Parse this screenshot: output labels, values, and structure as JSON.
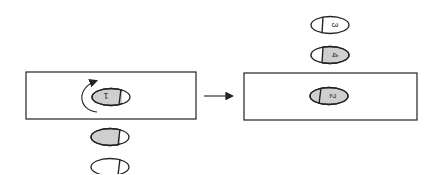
{
  "diagram": {
    "colors": {
      "stroke": "#222222",
      "shaded_fill": "#cfcfcf",
      "open_fill": "#ffffff",
      "box_stroke": "#333333"
    },
    "left_box": {
      "capsule": {
        "label": "1",
        "style": "shaded",
        "rotated": true
      },
      "rotation_arrow": "counterclockwise-curved-arrow"
    },
    "left_queue": [
      {
        "label": "",
        "style": "shaded"
      },
      {
        "label": "",
        "style": "open"
      }
    ],
    "transition_arrow": "right-arrow",
    "right_box": {
      "capsule": {
        "label": "2",
        "style": "shaded",
        "rotated": true
      }
    },
    "right_stack": [
      {
        "label": "3",
        "style": "open"
      },
      {
        "label": "4",
        "style": "shaded"
      }
    ]
  }
}
